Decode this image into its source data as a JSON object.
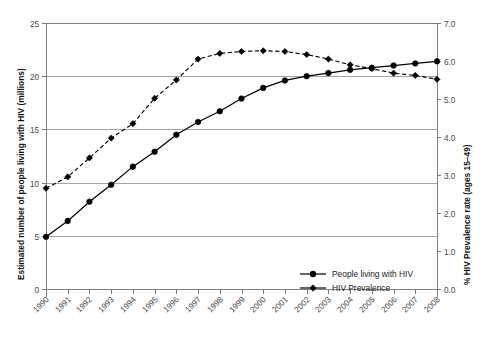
{
  "chart_data": {
    "type": "line",
    "title": "",
    "subtitle": "",
    "xlabel": "",
    "ylabel": "Estimated number of people living with HIV (millions)",
    "y2label": "% HIV Prevalence rate (ages 15–49)",
    "grid": true,
    "legend_position": "inside-bottom-center",
    "categories": [
      "1990",
      "1991",
      "1992",
      "1993",
      "1994",
      "1995",
      "1996",
      "1997",
      "1998",
      "1999",
      "2000",
      "2001",
      "2002",
      "2003",
      "2004",
      "2005",
      "2006",
      "2007",
      "2008"
    ],
    "x": [
      1990,
      1991,
      1992,
      1993,
      1994,
      1995,
      1996,
      1997,
      1998,
      1999,
      2000,
      2001,
      2002,
      2003,
      2004,
      2005,
      2006,
      2007,
      2008
    ],
    "ylim": [
      0,
      25
    ],
    "yticks": [
      0,
      5,
      10,
      15,
      20,
      25
    ],
    "ytick_labels": [
      "0",
      "5",
      "10",
      "15",
      "20",
      "25"
    ],
    "y2lim": [
      0,
      7
    ],
    "y2ticks": [
      0.0,
      1.0,
      2.0,
      3.0,
      4.0,
      5.0,
      6.0,
      7.0
    ],
    "y2tick_labels": [
      "0.0",
      "1.0",
      "2.0",
      "3.0",
      "4.0",
      "5.0",
      "6.0",
      "7.0"
    ],
    "series": [
      {
        "name": "People living with HIV",
        "axis": "left",
        "units": "millions",
        "line_style": "solid",
        "marker": "circle",
        "color": "#000000",
        "values": [
          4.9,
          6.4,
          8.2,
          9.8,
          11.5,
          12.9,
          14.5,
          15.7,
          16.7,
          17.9,
          18.9,
          19.6,
          20.0,
          20.3,
          20.6,
          20.8,
          21.0,
          21.2,
          21.4
        ]
      },
      {
        "name": "HIV Prevalence",
        "axis": "right",
        "units": "%",
        "line_style": "dashed",
        "marker": "diamond",
        "color": "#000000",
        "values": [
          2.65,
          2.95,
          3.45,
          3.97,
          4.35,
          5.02,
          5.5,
          6.05,
          6.2,
          6.25,
          6.27,
          6.25,
          6.17,
          6.05,
          5.9,
          5.8,
          5.68,
          5.62,
          5.52
        ]
      }
    ],
    "legend": [
      {
        "label": "People living with HIV",
        "marker": "circle",
        "line_style": "solid"
      },
      {
        "label": "HIV Prevalence",
        "marker": "diamond",
        "line_style": "solid"
      }
    ]
  },
  "caption": {
    "text": ""
  }
}
